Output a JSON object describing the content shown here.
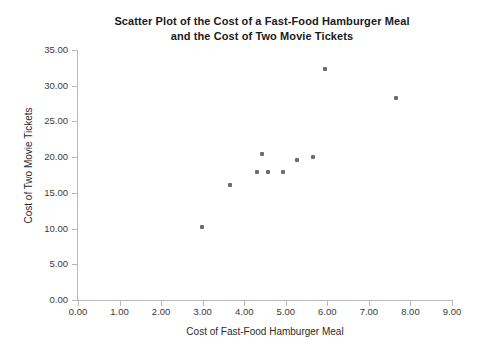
{
  "chart_data": {
    "type": "scatter",
    "title": "Scatter Plot of the Cost of a Fast-Food Hamburger Meal and the Cost of Two Movie Tickets",
    "title_lines": [
      "Scatter Plot of the Cost of a Fast-Food Hamburger Meal",
      "and the Cost of Two Movie Tickets"
    ],
    "xlabel": "Cost of Fast-Food Hamburger Meal",
    "ylabel": "Cost of Two Movie Tickets",
    "xlim": [
      0,
      9
    ],
    "ylim": [
      0,
      35
    ],
    "xticks": [
      0,
      1,
      2,
      3,
      4,
      5,
      6,
      7,
      8,
      9
    ],
    "yticks": [
      0,
      5,
      10,
      15,
      20,
      25,
      30,
      35
    ],
    "xticklabels": [
      "0.00",
      "1.00",
      "2.00",
      "3.00",
      "4.00",
      "5.00",
      "6.00",
      "7.00",
      "8.00",
      "9.00"
    ],
    "yticklabels": [
      "0.00",
      "5.00",
      "10.00",
      "15.00",
      "20.00",
      "25.00",
      "30.00",
      "35.00"
    ],
    "grid": false,
    "legend": false,
    "marker_color": "#6d6d70",
    "x": [
      2.98,
      3.66,
      4.31,
      4.43,
      4.57,
      4.93,
      5.27,
      5.65,
      5.94,
      7.65
    ],
    "y": [
      10.2,
      16.1,
      17.9,
      20.4,
      17.9,
      17.9,
      19.6,
      20.0,
      32.3,
      28.3
    ],
    "points": [
      {
        "x": 2.98,
        "y": 10.2
      },
      {
        "x": 3.66,
        "y": 16.1
      },
      {
        "x": 4.31,
        "y": 17.9
      },
      {
        "x": 4.43,
        "y": 20.4
      },
      {
        "x": 4.57,
        "y": 17.9
      },
      {
        "x": 4.93,
        "y": 17.9
      },
      {
        "x": 5.27,
        "y": 19.6
      },
      {
        "x": 5.65,
        "y": 20.0
      },
      {
        "x": 5.94,
        "y": 32.3
      },
      {
        "x": 7.65,
        "y": 28.3
      }
    ]
  }
}
